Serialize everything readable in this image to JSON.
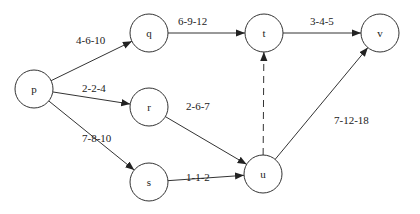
{
  "diagram": {
    "type": "network",
    "nodes": [
      {
        "id": "p",
        "label": "p",
        "x": 34,
        "y": 89
      },
      {
        "id": "q",
        "label": "q",
        "x": 149,
        "y": 33
      },
      {
        "id": "r",
        "label": "r",
        "x": 149,
        "y": 107
      },
      {
        "id": "s",
        "label": "s",
        "x": 149,
        "y": 182
      },
      {
        "id": "t",
        "label": "t",
        "x": 264,
        "y": 33
      },
      {
        "id": "u",
        "label": "u",
        "x": 263,
        "y": 174
      },
      {
        "id": "v",
        "label": "v",
        "x": 380,
        "y": 33
      }
    ],
    "edges": [
      {
        "from": "p",
        "to": "q",
        "label": "4-6-10",
        "style": "solid",
        "lx": 76,
        "ly": 44
      },
      {
        "from": "p",
        "to": "r",
        "label": "2-2-4",
        "style": "solid",
        "lx": 82,
        "ly": 92
      },
      {
        "from": "p",
        "to": "s",
        "label": "7-8-10",
        "style": "solid",
        "lx": 82,
        "ly": 142
      },
      {
        "from": "q",
        "to": "t",
        "label": "6-9-12",
        "style": "solid",
        "lx": 178,
        "ly": 25
      },
      {
        "from": "r",
        "to": "u",
        "label": "2-6-7",
        "style": "solid",
        "lx": 186,
        "ly": 110
      },
      {
        "from": "s",
        "to": "u",
        "label": "1-1-2",
        "style": "solid",
        "lx": 186,
        "ly": 181
      },
      {
        "from": "u",
        "to": "t",
        "label": "",
        "style": "dashed",
        "lx": 0,
        "ly": 0
      },
      {
        "from": "t",
        "to": "v",
        "label": "3-4-5",
        "style": "solid",
        "lx": 310,
        "ly": 25
      },
      {
        "from": "u",
        "to": "v",
        "label": "7-12-18",
        "style": "solid",
        "lx": 334,
        "ly": 124
      }
    ]
  }
}
